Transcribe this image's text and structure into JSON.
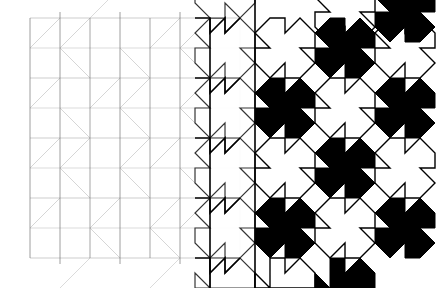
{
  "figure": {
    "title": "Tessellation Metamorphosis",
    "canvas": {
      "width": 446,
      "height": 288,
      "background": "#ffffff"
    }
  },
  "geometry": {
    "origin_x": 30,
    "origin_y": 18,
    "module": 30,
    "columns": 14,
    "rows": 9,
    "tile_span_modules": 2,
    "tile_columns": 7,
    "tile_rows": 4.5
  },
  "colors": {
    "background": "#ffffff",
    "ink": "#000000",
    "grid_faint": "#c9c9c9",
    "grid_mid": "#9a9a9a",
    "grid_strong": "#4a4a4a",
    "fill_black": "#000000",
    "fill_white": "#ffffff"
  },
  "stages": [
    {
      "name": "lattice",
      "x_from": 30,
      "x_to": 150,
      "outline_opacity": 0.3,
      "stroke_width": 0.7,
      "filled": false,
      "note": "faint orthogonal grid with light diagonals"
    },
    {
      "name": "emerging",
      "x_from": 150,
      "x_to": 210,
      "outline_opacity": 0.55,
      "stroke_width": 0.9,
      "filled": false,
      "note": "tile silhouettes begin to separate from the grid"
    },
    {
      "name": "outlined",
      "x_from": 210,
      "x_to": 300,
      "outline_opacity": 1.0,
      "stroke_width": 1.5,
      "filled": false,
      "note": "full black outlines, white fill, grid fading out"
    },
    {
      "name": "contrast",
      "x_from": 300,
      "x_to": 446,
      "outline_opacity": 1.0,
      "stroke_width": 1.5,
      "filled": true,
      "note": "alternating black and white interlocking tiles"
    }
  ],
  "tile": {
    "name": "interlocking-arrow-tile",
    "span_x": 60,
    "span_y": 60,
    "profile": "square edge with a triangular tab protruding on one side and a matching triangular notch cut from the opposite side, repeated on both axes"
  },
  "legend": {
    "grid_label": "grid",
    "tile_label": "tile",
    "black_label": "black",
    "white_label": "white"
  }
}
